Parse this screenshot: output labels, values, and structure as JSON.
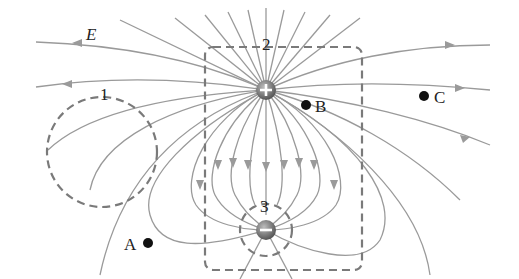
{
  "diagram": {
    "field_label": "E",
    "charges": [
      {
        "id": "positive",
        "sign": "+",
        "x": 266,
        "y": 90
      },
      {
        "id": "negative",
        "sign": "−",
        "x": 266,
        "y": 230
      }
    ],
    "points": [
      {
        "label": "A",
        "x": 148,
        "y": 243
      },
      {
        "label": "B",
        "x": 306,
        "y": 105
      },
      {
        "label": "C",
        "x": 424,
        "y": 96
      }
    ],
    "surfaces": [
      {
        "label": "1",
        "shape": "circle"
      },
      {
        "label": "2",
        "shape": "rounded-rectangle"
      },
      {
        "label": "3",
        "shape": "circle"
      }
    ],
    "colors": {
      "field_line": "#9a9a9a",
      "surface_dash": "#7a7a7a",
      "point": "#111111",
      "charge": "#6b6b6b"
    }
  }
}
